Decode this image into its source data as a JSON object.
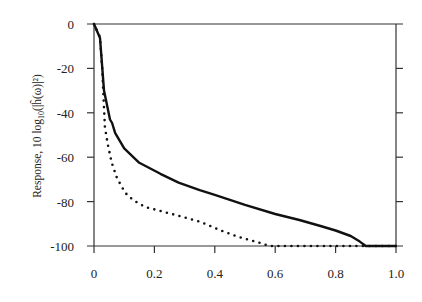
{
  "chart_data": {
    "type": "line",
    "title": "",
    "xlabel": "",
    "ylabel": "Response, 10 log10(|ĥ(ω)|²)",
    "ylabel_parts": {
      "prefix": "Response, 10 log",
      "sub": "10",
      "suffix": "(|ĥ(ω)|²)"
    },
    "xlim": [
      0,
      1.0
    ],
    "ylim": [
      -100,
      0
    ],
    "x_ticks": [
      0,
      0.2,
      0.4,
      0.6,
      0.8,
      1.0
    ],
    "x_tick_labels": [
      "0",
      "0.2",
      "0.4",
      "0.6",
      "0.8",
      "1.0"
    ],
    "y_ticks": [
      0,
      -20,
      -40,
      -60,
      -80,
      -100
    ],
    "y_tick_labels": [
      "0",
      "-20",
      "-40",
      "-60",
      "-80",
      "-100"
    ],
    "grid": false,
    "legend": null,
    "series": [
      {
        "name": "solid",
        "style": "solid",
        "color": "#111111",
        "x": [
          0,
          0.02,
          0.033,
          0.053,
          0.06,
          0.07,
          0.1,
          0.15,
          0.22,
          0.28,
          0.35,
          0.4,
          0.5,
          0.6,
          0.68,
          0.75,
          0.8,
          0.85,
          0.88,
          0.9,
          1.0
        ],
        "y": [
          0,
          -6.3,
          -30,
          -43,
          -44.6,
          -49,
          -56,
          -62.5,
          -67.5,
          -71.5,
          -74.8,
          -77,
          -81.5,
          -85.6,
          -88.3,
          -91,
          -93,
          -95.5,
          -98,
          -100,
          -100
        ]
      },
      {
        "name": "dotted",
        "style": "dotted",
        "color": "#111111",
        "x": [
          0,
          0.02,
          0.027,
          0.036,
          0.046,
          0.059,
          0.076,
          0.103,
          0.129,
          0.169,
          0.219,
          0.269,
          0.35,
          0.42,
          0.48,
          0.55,
          0.58,
          1.0
        ],
        "y": [
          0,
          -6,
          -20,
          -46.4,
          -54.5,
          -62.6,
          -69.4,
          -76,
          -79.3,
          -82.4,
          -84.2,
          -86,
          -89,
          -93,
          -96,
          -98.6,
          -100,
          -100
        ]
      }
    ]
  }
}
